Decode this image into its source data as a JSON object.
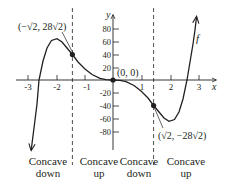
{
  "figure": {
    "function_label": "f",
    "x_axis_label": "x",
    "y_axis_label": "y",
    "x_ticks": [
      "-3",
      "-2",
      "-1",
      "1",
      "2",
      "3"
    ],
    "y_ticks": [
      "80",
      "60",
      "40",
      "20",
      "-20",
      "-40",
      "-60",
      "-80"
    ],
    "points": [
      {
        "label": "(−√2, 28√2)",
        "x": -1.414,
        "y": 39.6
      },
      {
        "label": "(0, 0)",
        "x": 0,
        "y": 0
      },
      {
        "label": "(√2, −28√2)",
        "x": 1.414,
        "y": -39.6
      }
    ],
    "regions": [
      {
        "line1": "Concave",
        "line2": "down"
      },
      {
        "line1": "Concave",
        "line2": "up"
      },
      {
        "line1": "Concave",
        "line2": "down"
      },
      {
        "line1": "Concave",
        "line2": "up"
      }
    ],
    "colors": {
      "ink": "#231f20",
      "background": "#ffffff"
    }
  }
}
